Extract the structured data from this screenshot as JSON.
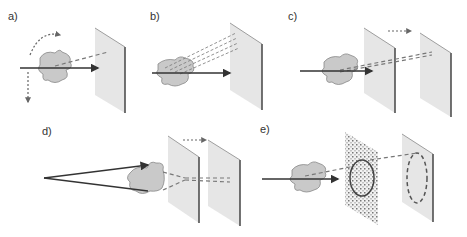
{
  "panels": [
    {
      "id": "a",
      "label": "a)"
    },
    {
      "id": "b",
      "label": "b)"
    },
    {
      "id": "c",
      "label": "c)"
    },
    {
      "id": "d",
      "label": "d)"
    },
    {
      "id": "e",
      "label": "e)"
    }
  ],
  "colors": {
    "screen_fill": "#e6e6e6",
    "screen_edge": "#444444",
    "object_fill": "#c9c9c9",
    "object_stroke": "#888888",
    "beam": "#333333",
    "dashed": "#777777"
  }
}
